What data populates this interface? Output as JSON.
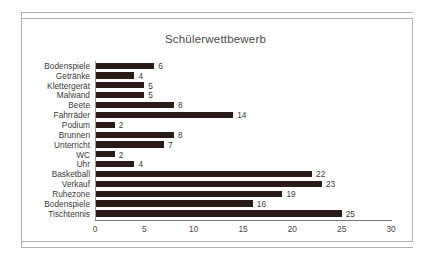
{
  "chart_data": {
    "type": "bar",
    "orientation": "horizontal",
    "title": "Schülerwettbewerb",
    "xlabel": "",
    "ylabel": "",
    "xlim": [
      0,
      30
    ],
    "xticks": [
      0,
      5,
      10,
      15,
      20,
      25,
      30
    ],
    "grid": false,
    "legend": null,
    "bar_color": "#2b1b18",
    "show_value_labels": true,
    "categories": [
      "Bodenspiele",
      "Getränke",
      "Klettergerät",
      "Malwand",
      "Beete",
      "Fahrräder",
      "Podium",
      "Brunnen",
      "Unterricht",
      "WC",
      "Uhr",
      "Basketball",
      "Verkauf",
      "Ruhezone",
      "Bodenspiele",
      "Tischtennis"
    ],
    "values": [
      6,
      4,
      5,
      5,
      8,
      14,
      2,
      8,
      7,
      2,
      4,
      22,
      23,
      19,
      16,
      25
    ]
  }
}
